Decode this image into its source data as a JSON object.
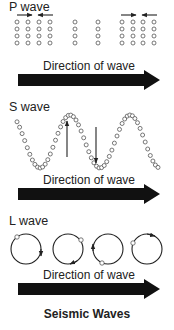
{
  "figure": {
    "title": "Seismic Waves",
    "colors": {
      "arrow_fill": "#111111",
      "text": "#222222",
      "particle_stroke": "#555555",
      "background": "#ffffff"
    }
  },
  "panels": [
    {
      "id": "p-wave",
      "label": "P wave",
      "direction_label": "Direction of wave",
      "description": "Particles compress and expand along direction of travel",
      "particle_grid": {
        "rows": 4,
        "column_groups": [
          {
            "columns": 4,
            "note": "compressed cluster"
          },
          {
            "columns": 1,
            "note": "rarefied"
          },
          {
            "columns": 1,
            "note": "rarefied"
          },
          {
            "columns": 4,
            "note": "compressed cluster"
          }
        ]
      },
      "motion_arrows": [
        "right",
        "left",
        "right",
        "left"
      ]
    },
    {
      "id": "s-wave",
      "label": "S wave",
      "direction_label": "Direction of wave",
      "description": "Particles move perpendicular to direction of travel",
      "motion_arrows": [
        "up",
        "down"
      ]
    },
    {
      "id": "l-wave",
      "label": "L wave",
      "direction_label": "Direction of wave",
      "description": "Particles move in circular orbits",
      "orbits": [
        {
          "particle_position": "top-left",
          "arrow_position": "right",
          "arrow_dir": "down"
        },
        {
          "particle_position": "upper-right",
          "arrow_position": "bottom",
          "arrow_dir": "left"
        },
        {
          "particle_position": "bottom",
          "arrow_position": "left",
          "arrow_dir": "up"
        },
        {
          "particle_position": "left",
          "arrow_position": "top",
          "arrow_dir": "right"
        }
      ]
    }
  ]
}
